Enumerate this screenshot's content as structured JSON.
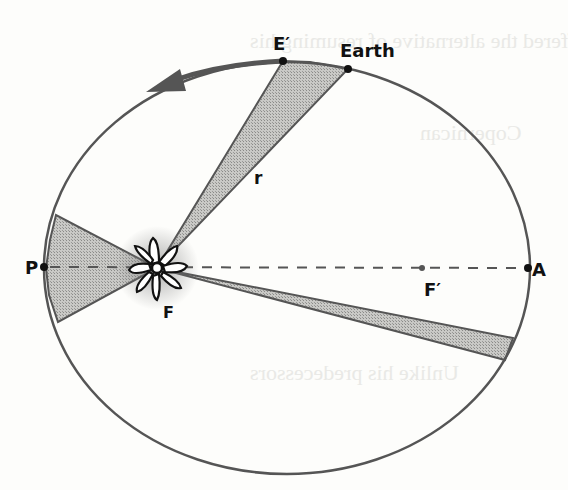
{
  "diagram": {
    "labels": {
      "earth": "Earth",
      "e_prime": "E′",
      "radius": "r",
      "perihelion": "P",
      "aphelion": "A",
      "focus": "F",
      "empty_focus": "F′"
    },
    "orbit": {
      "shape": "ellipse",
      "direction": "counterclockwise"
    },
    "sectors": [
      "near-perihelion sector",
      "E′-Earth sector",
      "near-aphelion sector"
    ],
    "colors": {
      "line": "#555555",
      "fill": "#b8b8b8",
      "ink": "#111111"
    }
  }
}
